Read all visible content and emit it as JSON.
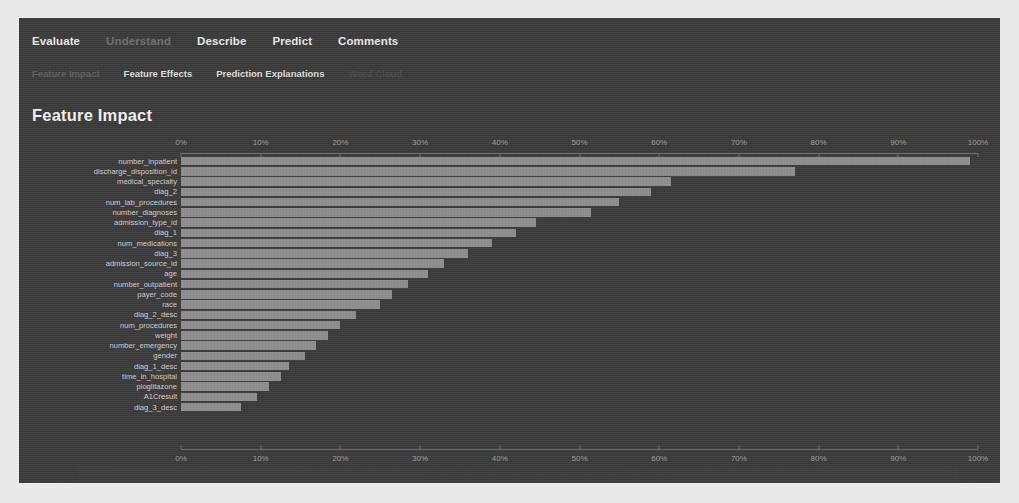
{
  "window": {
    "title": "Feature Impact"
  },
  "nav": {
    "main_tabs": [
      {
        "label": "Evaluate",
        "state": "active"
      },
      {
        "label": "Understand",
        "state": "dim"
      },
      {
        "label": "Describe",
        "state": "active"
      },
      {
        "label": "Predict",
        "state": "active"
      },
      {
        "label": "Comments",
        "state": "active"
      }
    ],
    "sub_tabs": [
      {
        "label": "Feature Impact",
        "state": "dim"
      },
      {
        "label": "Feature Effects",
        "state": "active"
      },
      {
        "label": "Prediction Explanations",
        "state": "active"
      },
      {
        "label": "Word Cloud",
        "state": "dimmer"
      }
    ]
  },
  "colors": {
    "window_bg": "#3a3a3a",
    "bar": "#8d8d8d",
    "axis": "#6d6d6d",
    "text": "#e6e6e6",
    "text_dim": "#6e6e6e"
  },
  "chart_data": {
    "type": "bar",
    "orientation": "horizontal",
    "title": "Feature Impact",
    "xlabel": "",
    "ylabel": "",
    "xlim": [
      0,
      100
    ],
    "xtick_labels": [
      "0%",
      "10%",
      "20%",
      "30%",
      "40%",
      "50%",
      "60%",
      "70%",
      "80%",
      "90%",
      "100%"
    ],
    "xticks": [
      0,
      10,
      20,
      30,
      40,
      50,
      60,
      70,
      80,
      90,
      100
    ],
    "grid": false,
    "legend": "none",
    "axis_top": true,
    "axis_bottom": true,
    "categories": [
      "number_inpatient",
      "discharge_disposition_id",
      "medical_specialty",
      "diag_2",
      "num_lab_procedures",
      "number_diagnoses",
      "admission_type_id",
      "diag_1",
      "num_medications",
      "diag_3",
      "admission_source_id",
      "age",
      "number_outpatient",
      "payer_code",
      "race",
      "diag_2_desc",
      "num_procedures",
      "weight",
      "number_emergency",
      "gender",
      "diag_1_desc",
      "time_in_hospital",
      "pioglitazone",
      "A1Cresult",
      "diag_3_desc"
    ],
    "values": [
      99.0,
      77.0,
      61.5,
      59.0,
      55.0,
      51.5,
      44.5,
      42.0,
      39.0,
      36.0,
      33.0,
      31.0,
      28.5,
      26.5,
      25.0,
      22.0,
      20.0,
      18.5,
      17.0,
      15.5,
      13.5,
      12.5,
      11.0,
      9.5,
      7.5
    ]
  }
}
